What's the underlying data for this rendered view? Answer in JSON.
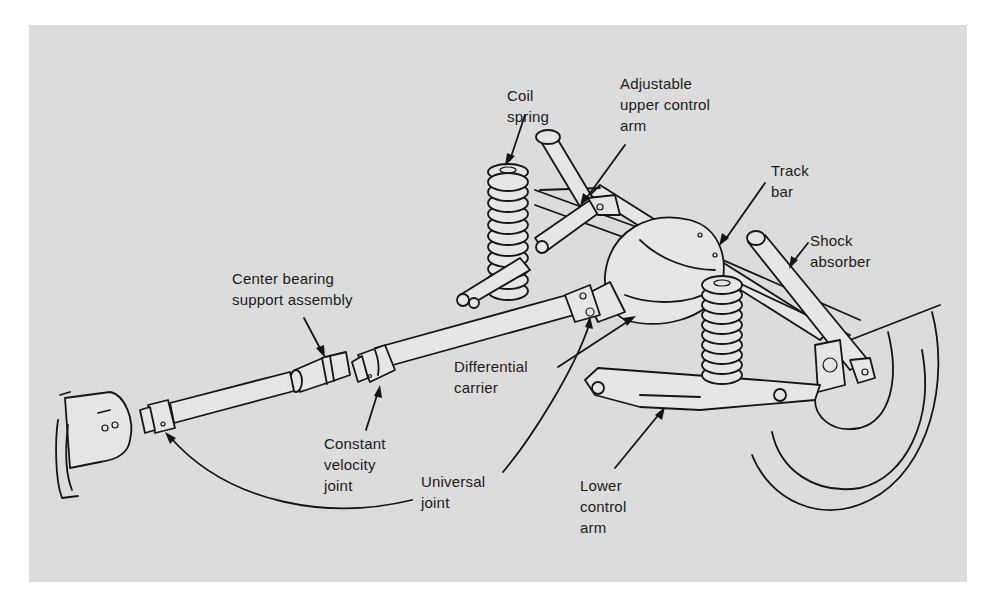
{
  "figure": {
    "background": "#dcdcdc",
    "line_color": "#151515"
  },
  "labels": {
    "coil_spring": "Coil\nspring",
    "adjustable_upper_control_arm": "Adjustable\nupper control\narm",
    "track_bar": "Track\nbar",
    "shock_absorber": "Shock\nabsorber",
    "center_bearing_support_assembly": "Center bearing\nsupport assembly",
    "differential_carrier": "Differential\ncarrier",
    "constant_velocity_joint": "Constant\nvelocity\njoint",
    "universal_joint": "Universal\njoint",
    "lower_control_arm": "Lower\ncontrol\narm"
  }
}
